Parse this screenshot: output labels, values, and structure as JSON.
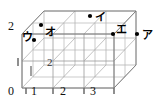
{
  "figure": {
    "box": {
      "x_divisions": 3,
      "y_divisions": 2,
      "z_divisions": 2,
      "line_color": "#a0a0a0",
      "edge_color": "#8a8a8a"
    },
    "axes": {
      "x_ticks": [
        "0",
        "1",
        "2",
        "3"
      ],
      "y_ticks": [
        "2"
      ],
      "z_ticks": [
        "2"
      ],
      "origin_label": "0"
    },
    "points": [
      {
        "id": "a",
        "label": "ア",
        "dot_x": 137,
        "dot_y": 34,
        "label_x": 142,
        "label_y": 30
      },
      {
        "id": "i",
        "label": "イ",
        "dot_x": 90,
        "dot_y": 16,
        "label_x": 95,
        "label_y": 12
      },
      {
        "id": "u",
        "label": "ウ",
        "dot_x": 34,
        "dot_y": 40,
        "label_x": 23,
        "label_y": 32
      },
      {
        "id": "e",
        "label": "エ",
        "dot_x": 113,
        "dot_y": 34,
        "label_x": 116,
        "label_y": 25
      },
      {
        "id": "o",
        "label": "オ",
        "dot_x": 41,
        "dot_y": 25,
        "label_x": 45,
        "label_y": 27
      }
    ],
    "colors": {
      "background": "#ffffff",
      "grid": "#a8a8a8",
      "text": "#111111",
      "dot": "#000000"
    }
  }
}
